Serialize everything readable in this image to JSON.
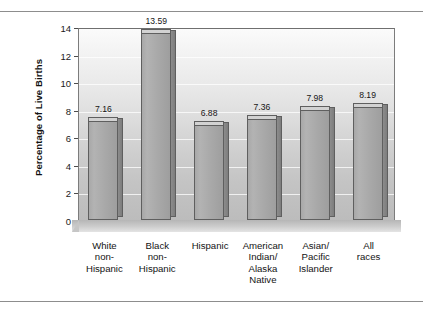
{
  "chart_data": {
    "type": "bar",
    "title": "",
    "xlabel": "",
    "ylabel": "Percentage of Live Births",
    "ylim": [
      0,
      14
    ],
    "yticks": [
      0,
      2,
      4,
      6,
      8,
      10,
      12,
      14
    ],
    "ytick_labels": [
      "0",
      "2",
      "4",
      "6",
      "8",
      "10",
      "12",
      "14"
    ],
    "grid": true,
    "legend": "none",
    "categories": [
      "White non-Hispanic",
      "Black non-Hispanic",
      "Hispanic",
      "American Indian/ Alaska Native",
      "Asian/ Pacific Islander",
      "All races"
    ],
    "category_lines": [
      [
        "White",
        "non-",
        "Hispanic"
      ],
      [
        "Black",
        "non-",
        "Hispanic"
      ],
      [
        "Hispanic"
      ],
      [
        "American",
        "Indian/",
        "Alaska",
        "Native"
      ],
      [
        "Asian/",
        "Pacific",
        "Islander"
      ],
      [
        "All",
        "races"
      ]
    ],
    "values": [
      7.16,
      13.59,
      6.88,
      7.36,
      7.98,
      8.19
    ],
    "value_labels": [
      "7.16",
      "13.59",
      "6.88",
      "7.36",
      "7.98",
      "8.19"
    ],
    "bar_color": "#a9a9a9",
    "bar_top_color": "#d2d2d2",
    "bar_side_color": "#848484",
    "plot_bg_top": "#fbfbfb",
    "plot_bg_bottom": "#bcbcbc",
    "axis_color": "#5f5f5f"
  }
}
